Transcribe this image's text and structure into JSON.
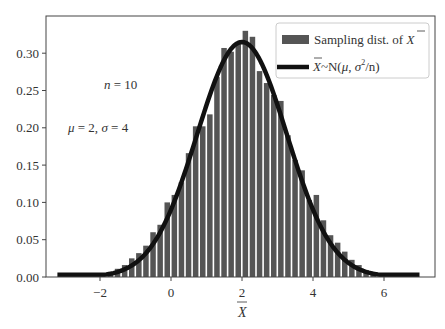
{
  "chart_data": {
    "type": "bar",
    "title": "",
    "xlabel": "X̄",
    "ylabel": "",
    "xlim": [
      -3.5,
      7.4
    ],
    "ylim": [
      0,
      0.35
    ],
    "x_ticks": [
      -2,
      0,
      2,
      4,
      6
    ],
    "x_tick_labels": [
      "−2",
      "0",
      "2",
      "4",
      "6"
    ],
    "y_ticks": [
      0.0,
      0.05,
      0.1,
      0.15,
      0.2,
      0.25,
      0.3
    ],
    "y_tick_labels": [
      "0.00",
      "0.05",
      "0.10",
      "0.15",
      "0.20",
      "0.25",
      "0.30"
    ],
    "grid": false,
    "legend_position": "upper right",
    "annotations": [
      {
        "text": "n = 10",
        "x": -1.3,
        "y": 0.257
      },
      {
        "text": "μ = 2, σ = 4",
        "x": -2.9,
        "y": 0.199
      }
    ],
    "series": [
      {
        "name": "Sampling dist. of X̄",
        "kind": "histogram",
        "color": "#555555",
        "bin_width": 0.2,
        "bin_centers": [
          -1.7,
          -1.5,
          -1.3,
          -1.1,
          -0.9,
          -0.7,
          -0.5,
          -0.3,
          -0.1,
          0.1,
          0.3,
          0.5,
          0.7,
          0.9,
          1.1,
          1.3,
          1.5,
          1.7,
          1.9,
          2.1,
          2.3,
          2.5,
          2.7,
          2.9,
          3.1,
          3.3,
          3.5,
          3.7,
          3.9,
          4.1,
          4.3,
          4.5,
          4.7,
          4.9,
          5.1,
          5.3,
          5.5,
          5.7
        ],
        "values": [
          0.007,
          0.011,
          0.016,
          0.025,
          0.032,
          0.042,
          0.06,
          0.07,
          0.1,
          0.11,
          0.127,
          0.166,
          0.202,
          0.202,
          0.218,
          0.268,
          0.307,
          0.302,
          0.315,
          0.33,
          0.322,
          0.276,
          0.26,
          0.244,
          0.236,
          0.19,
          0.157,
          0.143,
          0.103,
          0.11,
          0.076,
          0.056,
          0.046,
          0.034,
          0.023,
          0.016,
          0.009,
          0.005
        ]
      },
      {
        "name": "X̄~N(μ, σ²/n)",
        "kind": "line",
        "color": "#111111",
        "mu": 2,
        "sigma_sq_over_n": 1.6,
        "x_range": [
          -3.2,
          7.0
        ],
        "peak": 0.315
      }
    ]
  },
  "legend": {
    "hist_label_prefix": "Sampling dist. of ",
    "hist_label_var": "X",
    "line_label_var": "X",
    "line_label_suffix_a": "~N(",
    "line_label_mu": "μ",
    "line_label_mid": ", ",
    "line_label_sigma": "σ",
    "line_label_sup": "2",
    "line_label_end": "/n)"
  },
  "annotations": {
    "n_label_var": "n",
    "n_label_val": " = 10",
    "params_mu": "μ",
    "params_mu_val": " = 2, ",
    "params_sigma": "σ",
    "params_sigma_val": " = 4"
  },
  "axes": {
    "xlabel": "X"
  }
}
